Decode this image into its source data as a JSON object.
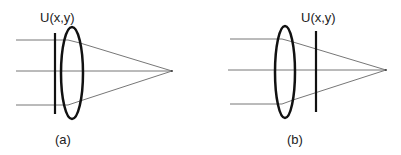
{
  "panels": [
    {
      "id": "a",
      "caption": "(a)",
      "field_label": "U(x,y)",
      "description": "Input plane placed before the lens"
    },
    {
      "id": "b",
      "caption": "(b)",
      "field_label": "U(x,y)",
      "description": "Input plane placed after the lens"
    }
  ],
  "colors": {
    "ray": "#777777",
    "element": "#111111",
    "text": "#222222"
  }
}
